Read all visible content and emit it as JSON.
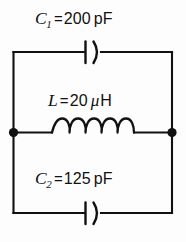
{
  "figure": {
    "kind": "electrical-schematic",
    "background_color": "#fdfdfd",
    "line_color": "#111111"
  },
  "components": {
    "c1": {
      "symbol": "C",
      "subscript": "1",
      "equals": "=",
      "value": "200",
      "unit": "pF",
      "type": "capacitor",
      "branch": "top"
    },
    "l": {
      "symbol": "L",
      "subscript": "",
      "equals": "=",
      "value": "20",
      "prefix": "μ",
      "unit": "H",
      "type": "inductor",
      "branch": "middle",
      "coil_loops": 5
    },
    "c2": {
      "symbol": "C",
      "subscript": "2",
      "equals": "=",
      "value": "125",
      "unit": "pF",
      "type": "capacitor",
      "branch": "bottom"
    }
  },
  "nodes": {
    "left_junction_label": "left node",
    "right_junction_label": "right node"
  }
}
